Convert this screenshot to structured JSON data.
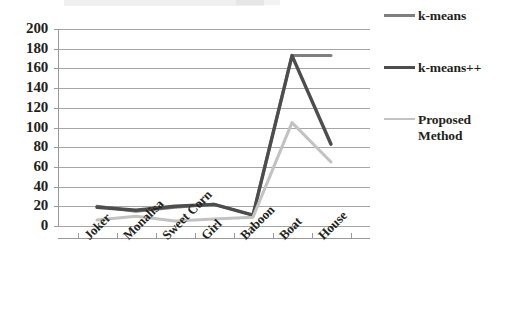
{
  "chart_data": {
    "type": "line",
    "title": "",
    "xlabel": "",
    "ylabel": "",
    "categories": [
      "Joker",
      "Monalisa",
      "Sweet Corn",
      "Girl",
      "Baboon",
      "Boat",
      "House"
    ],
    "series": [
      {
        "name": "k-means",
        "color": "#7f7f7f",
        "width": 3.0,
        "values": [
          20,
          15,
          19,
          22,
          11,
          173,
          173
        ]
      },
      {
        "name": "k-means++",
        "color": "#4d4d4d",
        "width": 3.4,
        "values": [
          19,
          16,
          20,
          22,
          11,
          173,
          83
        ]
      },
      {
        "name": "Proposed Method",
        "color": "#c2c2c2",
        "width": 3.0,
        "values": [
          6,
          10,
          5,
          7,
          9,
          105,
          65
        ]
      }
    ],
    "ylim": [
      0,
      200
    ],
    "ytick_step": 20,
    "yticks": [
      200,
      180,
      160,
      140,
      120,
      100,
      80,
      60,
      40,
      20,
      0
    ],
    "ytick_labels": [
      "200",
      "180",
      "160",
      "140",
      "120",
      "100",
      "80",
      "60",
      "40",
      "20",
      "0"
    ],
    "grid": {
      "horizontal": true,
      "vertical": false,
      "color": "#a6a6a6"
    },
    "legend": {
      "position": "right",
      "entries": [
        {
          "label": "k-means",
          "color": "#7f7f7f",
          "width": 3.0
        },
        {
          "label": "k-means++",
          "color": "#4d4d4d",
          "width": 3.4
        },
        {
          "label": "Proposed\nMethod",
          "color": "#c2c2c2",
          "width": 2.2
        }
      ]
    },
    "axis": {
      "line_color": "#9a9a9a",
      "tick_color": "#9a9a9a"
    }
  }
}
